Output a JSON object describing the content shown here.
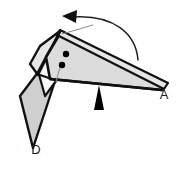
{
  "figure": {
    "kind": "origami-fold-step-diagram",
    "canvas": {
      "width": 185,
      "height": 169
    },
    "background_color": "#ffffff",
    "colors": {
      "paper_light": "#dcdcdc",
      "paper_mid": "#cfcfcf",
      "paper_pale": "#e6e6e6",
      "paper_white": "#f7f7f7",
      "outline": "#111111",
      "crease_line": "#8c8c8c",
      "marker_dot": "#000000",
      "pointer": "#000000",
      "arrow": "#222222",
      "label_text": "#1a1a1a"
    },
    "labels": [
      {
        "id": "label-a",
        "text": "A",
        "x": 164,
        "y": 99
      },
      {
        "id": "label-d",
        "text": "D",
        "x": 36,
        "y": 154
      }
    ],
    "markers": {
      "dots": [
        {
          "id": "dot-upper",
          "cx": 66,
          "cy": 54,
          "r": 3.2
        },
        {
          "id": "dot-lower",
          "cx": 62,
          "cy": 65,
          "r": 3.2
        }
      ],
      "pointer_triangle": {
        "id": "pointer-up",
        "description": "solid black triangle pointing up at the lower edge",
        "points": "99,85 104,110 94,110"
      }
    },
    "rotation_arrow": {
      "id": "rotation-arrow",
      "direction": "counterclockwise-to-left",
      "path": "M 138,60 C 136,34 114,14 72,17",
      "head_points": "62,16 77,10 76,23"
    },
    "creases": [
      {
        "id": "crease-top-right",
        "x1": 62,
        "y1": 34,
        "x2": 93,
        "y2": 25
      },
      {
        "id": "crease-lower-left",
        "x1": 61,
        "y1": 64,
        "x2": 56,
        "y2": 82
      }
    ],
    "paper_shapes": [
      {
        "id": "main-wing",
        "description": "large right-pointing wing ending at vertex A",
        "points": "60,31 166,84 163,90 49,78 46,56"
      },
      {
        "id": "wing-under-band",
        "description": "dark band along the top-right leading edge",
        "points": "60,31 167,83 164,89 58,36"
      },
      {
        "id": "left-upper-flap",
        "description": "folded flap on the upper-left of the model",
        "points": "60,31 46,56 37,74 31,63 39,46"
      },
      {
        "id": "left-lower-flap",
        "description": "long flap hanging down-left to vertex D",
        "points": "45,63 56,78 33,148 20,96"
      },
      {
        "id": "left-inner-sliver",
        "description": "narrow inner sliver between the two left flaps",
        "points": "47,60 58,76 45,95 39,72"
      }
    ]
  }
}
